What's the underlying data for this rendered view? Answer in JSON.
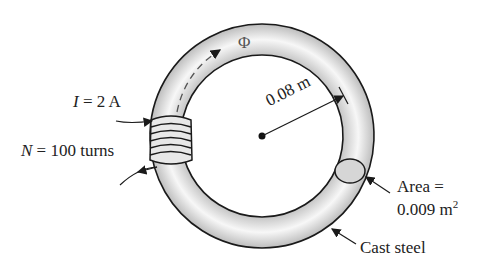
{
  "diagram": {
    "type": "toroid-magnetic-circuit",
    "flux_symbol": "Φ",
    "current": {
      "symbol": "I",
      "eq": "=",
      "value": "2 A"
    },
    "turns": {
      "symbol": "N",
      "eq": "=",
      "value": "100 turns"
    },
    "radius_label": "0.08 m",
    "area": {
      "line1": "Area  =",
      "line2_value": "0.009 m",
      "line2_sup": "2"
    },
    "material": "Cast steel",
    "colors": {
      "ring_fill_light": "#f4f4f4",
      "ring_fill_dark": "#bdbdbd",
      "outline": "#1a1a1a",
      "cross_section": "#d6d6d6"
    }
  }
}
